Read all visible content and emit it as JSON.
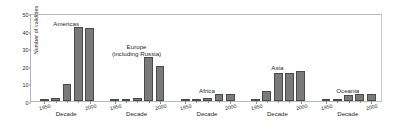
{
  "chart_data": {
    "type": "bar",
    "title": "",
    "xlabel": "Decade",
    "ylabel": "Number of validities",
    "ylim": [
      0,
      50
    ],
    "yticks": [
      0,
      10,
      20,
      30,
      40,
      50
    ],
    "xticks": [
      "1950",
      "2000"
    ],
    "grid": false,
    "legend": "none",
    "panel_layout": "small-multiples, shared y-axis",
    "categories": [
      "1950",
      "1960",
      "1970",
      "1980",
      "1990",
      "2000"
    ],
    "panels": [
      {
        "name": "Americas",
        "label": "Americas",
        "x": [
          "1950",
          "1960",
          "1970",
          "1980",
          "1990"
        ],
        "values": [
          0.5,
          1.5,
          9.5,
          42,
          41.5
        ]
      },
      {
        "name": "Europe",
        "label": "Europe\n(including Russia)",
        "x": [
          "1950",
          "1960",
          "1970",
          "1980",
          "1990"
        ],
        "values": [
          0.3,
          0.7,
          1.5,
          25,
          20
        ]
      },
      {
        "name": "Africa",
        "label": "Africa",
        "x": [
          "1950",
          "1960",
          "1970",
          "1980",
          "1990"
        ],
        "values": [
          0.3,
          0.7,
          1.7,
          4,
          4
        ]
      },
      {
        "name": "Asia",
        "label": "Asia",
        "x": [
          "1950",
          "1960",
          "1970",
          "1980",
          "1990"
        ],
        "values": [
          0.7,
          5.5,
          16,
          16,
          17
        ]
      },
      {
        "name": "Oceania",
        "label": "Oceania",
        "x": [
          "1950",
          "1960",
          "1970",
          "1980",
          "1990"
        ],
        "values": [
          0.2,
          0.3,
          3.5,
          4,
          4
        ]
      }
    ],
    "colors": {
      "bar_fill": "#7a7a7a",
      "bar_edge": "#4a4a4a",
      "axis": "#8e8e8e",
      "text": "#1f1f1f",
      "background": "#ffffff"
    }
  }
}
